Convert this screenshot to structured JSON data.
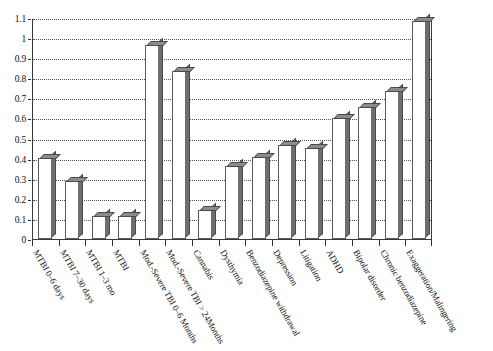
{
  "chart_data": {
    "type": "bar",
    "title": "",
    "xlabel": "",
    "ylabel": "",
    "ylim": [
      0,
      1.1
    ],
    "grid": true,
    "legend": "none",
    "ytick_labels": [
      "0",
      "0.1",
      "0.2",
      "0.3",
      "0.4",
      "0.5",
      "0.6",
      "0.7",
      "0.8",
      "0.9",
      "1",
      "1.1"
    ],
    "ytick_values": [
      0,
      0.1,
      0.2,
      0.3,
      0.4,
      0.5,
      0.6,
      0.7,
      0.8,
      0.9,
      1.0,
      1.1
    ],
    "categories": [
      "MTBI 0–6 days",
      "MTBI 7–30 days",
      "MTBI 1–3 mo",
      "MTBI",
      "Mod.-Severe TBI 0–6 Months",
      "Mod.-Severe TBI > 24Months",
      "Cannabis",
      "Dysthymia",
      "Benzodiazepine withdrawal",
      "Depression",
      "Litigation",
      "ADHD",
      "Bipolar disorder",
      "Chronic benzodiazepine",
      "Exaggeration/Malingering"
    ],
    "values": [
      0.405,
      0.29,
      0.115,
      0.115,
      0.965,
      0.835,
      0.145,
      0.365,
      0.41,
      0.47,
      0.455,
      0.6,
      0.655,
      0.735,
      1.085
    ]
  },
  "style": {
    "bar_face_color": "#ffffff",
    "bar_edge_color": "#5a5a5a",
    "bar_side_color": "#6e6e6e",
    "bar_top_color": "#8c8c8c",
    "grid_color": "#555555",
    "axis_color": "#3a3a3a",
    "background": "#ffffff"
  }
}
